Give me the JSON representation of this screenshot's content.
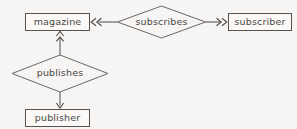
{
  "diagram": {
    "kind": "entity-relationship-diagram",
    "background_color": "#f6f5f3",
    "stroke_color": "#555250",
    "text_color": "#4a4745",
    "entities": [
      {
        "id": "magazine",
        "label": "magazine",
        "shape": "rectangle",
        "x": 25,
        "y": 13,
        "width": 65,
        "height": 18
      },
      {
        "id": "subscriber",
        "label": "subscriber",
        "shape": "rectangle",
        "x": 228,
        "y": 13,
        "width": 64,
        "height": 18
      },
      {
        "id": "publisher",
        "label": "publisher",
        "shape": "rectangle",
        "x": 25,
        "y": 109,
        "width": 65,
        "height": 18
      }
    ],
    "relationships": [
      {
        "id": "subscribes",
        "label": "subscribes",
        "shape": "diamond",
        "cx": 161.5,
        "cy": 22,
        "rx": 44,
        "ry": 16
      },
      {
        "id": "publishes",
        "label": "publishes",
        "shape": "diamond",
        "cx": 60,
        "cy": 73.5,
        "rx": 48,
        "ry": 18.5
      }
    ],
    "connectors": [
      {
        "id": "subscribes-to-magazine",
        "from": "subscribes",
        "to": "magazine",
        "direction": "left",
        "cardinality": "many",
        "arrowheads": 2
      },
      {
        "id": "subscribes-to-subscriber",
        "from": "subscribes",
        "to": "subscriber",
        "direction": "right",
        "cardinality": "many",
        "arrowheads": 2
      },
      {
        "id": "publishes-to-magazine",
        "from": "publishes",
        "to": "magazine",
        "direction": "up",
        "cardinality": "many",
        "arrowheads": 2
      },
      {
        "id": "publishes-to-publisher",
        "from": "publishes",
        "to": "publisher",
        "direction": "down",
        "cardinality": "one",
        "arrowheads": 1
      }
    ]
  }
}
